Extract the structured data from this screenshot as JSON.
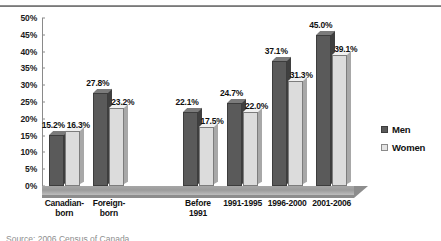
{
  "chart_data": {
    "type": "bar",
    "title": "",
    "subtitle": "",
    "xlabel": "",
    "ylabel": "",
    "ylim": [
      0,
      50
    ],
    "ytick_step": 5,
    "ytick_labels": [
      "50%",
      "45%",
      "40%",
      "35%",
      "30%",
      "25%",
      "20%",
      "15%",
      "10%",
      "5%",
      "0%"
    ],
    "grid": false,
    "legend_position": "right",
    "value_suffix": "%",
    "categories": [
      "Canadian-born",
      "Foreign-born",
      "Before 1991",
      "1991-1995",
      "1996-2000",
      "2001-2006"
    ],
    "category_lines": [
      [
        "Canadian-",
        "born"
      ],
      [
        "Foreign-",
        "born"
      ],
      [
        "Before",
        "1991"
      ],
      [
        "1991-1995"
      ],
      [
        "1996-2000"
      ],
      [
        "2001-2006"
      ]
    ],
    "series": [
      {
        "name": "Men",
        "color": "#5a5a5a",
        "values": [
          15.2,
          27.8,
          22.1,
          24.7,
          37.1,
          45.0
        ],
        "labels": [
          "15.2%",
          "27.8%",
          "22.1%",
          "24.7%",
          "37.1%",
          "45.0%"
        ]
      },
      {
        "name": "Women",
        "color": "#dcdcdc",
        "values": [
          16.3,
          23.2,
          17.5,
          22.0,
          31.3,
          39.1
        ],
        "labels": [
          "16.3%",
          "23.2%",
          "17.5%",
          "22.0%",
          "31.3%",
          "39.1%"
        ]
      }
    ],
    "group_gap_after_index": 1
  },
  "legend": {
    "items": [
      {
        "label": "Men"
      },
      {
        "label": "Women"
      }
    ]
  },
  "source": {
    "text": "Source: 2006 Census of Canada"
  },
  "colors": {
    "men": "#5a5a5a",
    "women": "#dcdcdc",
    "axis": "#8a8a8a",
    "floor": "#9b9b9b",
    "text": "#111111"
  }
}
